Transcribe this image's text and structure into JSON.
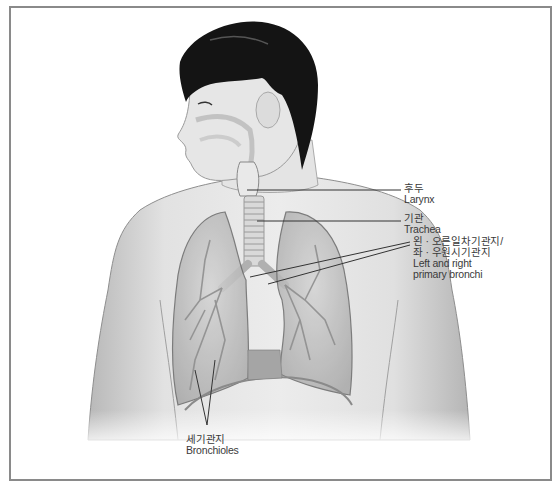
{
  "figure": {
    "colors": {
      "frame": "#8a8a8a",
      "skin": "#d9d9d9",
      "hair": "#111111",
      "lung": "#bdbdbd",
      "leader_line": "#333333",
      "text": "#3a3a3a"
    }
  },
  "labels": {
    "larynx": {
      "ko": "후두",
      "en": "Larynx"
    },
    "trachea": {
      "ko": "기관",
      "en": "Trachea"
    },
    "bronchi": {
      "ko_line1": "왼 · 오른일차기관지/",
      "ko_line2": "좌 · 우원시기관지",
      "en_line1": "Left and right",
      "en_line2": "primary bronchi"
    },
    "bronchioles": {
      "ko": "세기관지",
      "en": "Bronchioles"
    }
  }
}
